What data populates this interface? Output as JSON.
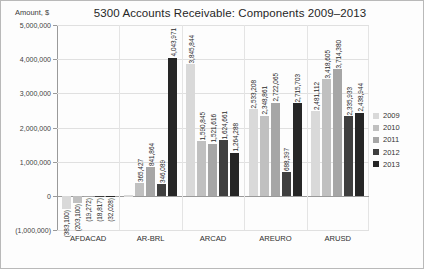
{
  "header": {
    "axis_title": "Amount, $",
    "title": "5300 Accounts Receivable: Components 2009–2013"
  },
  "legend": {
    "position": "right",
    "entries": [
      {
        "label": "2009",
        "color": "#d9d9d9"
      },
      {
        "label": "2010",
        "color": "#c0c0c0"
      },
      {
        "label": "2011",
        "color": "#a6a6a6"
      },
      {
        "label": "2012",
        "color": "#3f3f3f"
      },
      {
        "label": "2013",
        "color": "#262626"
      }
    ]
  },
  "yaxis": {
    "ticks": [
      "5,000,000",
      "4,000,000",
      "3,000,000",
      "2,000,000",
      "1,000,000",
      "0",
      "(1,000,000)"
    ],
    "values": [
      5000000,
      4000000,
      3000000,
      2000000,
      1000000,
      0,
      -1000000
    ]
  },
  "chart_data": {
    "type": "bar",
    "title": "5300 Accounts Receivable: Components 2009–2013",
    "xlabel": "",
    "ylabel": "Amount, $",
    "ylim": [
      -1000000,
      5000000
    ],
    "grid": true,
    "legend_position": "right",
    "categories": [
      "AFDACAD",
      "AR-BRL",
      "ARCAD",
      "AREURO",
      "ARUSD"
    ],
    "series": [
      {
        "name": "2009",
        "color": "#d9d9d9",
        "values": [
          -383100,
          12000,
          3845844,
          2533208,
          2481112
        ],
        "labels": [
          "(383,100)",
          "",
          "3,845,844",
          "2,533,208",
          "2,481,112"
        ]
      },
      {
        "name": "2010",
        "color": "#c0c0c0",
        "values": [
          -203100,
          365427,
          1590845,
          2348861,
          3418605
        ],
        "labels": [
          "(203,100)",
          "365,427",
          "1,590,845",
          "2,348,861",
          "3,418,605"
        ]
      },
      {
        "name": "2011",
        "color": "#a6a6a6",
        "values": [
          -19272,
          841864,
          1521616,
          2722065,
          3714380
        ],
        "labels": [
          "(19,272)",
          "841,864",
          "1,521,616",
          "2,722,065",
          "3,714,380"
        ]
      },
      {
        "name": "2012",
        "color": "#3f3f3f",
        "values": [
          -18817,
          346089,
          1624661,
          688397,
          2335933
        ],
        "labels": [
          "(18,817)",
          "346,089",
          "1,624,661",
          "688,397",
          "2,335,933"
        ]
      },
      {
        "name": "2013",
        "color": "#262626",
        "values": [
          -32028,
          4043971,
          1264288,
          2715703,
          2438944
        ],
        "labels": [
          "(32,028)",
          "4,043,971",
          "1,264,288",
          "2,715,703",
          "2,438,944"
        ]
      }
    ]
  }
}
